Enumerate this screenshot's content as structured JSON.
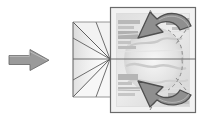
{
  "figure": {
    "width": 203,
    "height": 119,
    "background_color": "#ffffff",
    "description": "A gray block arrow points right toward a bowtie-shaped projection cone, which converges on a framed banknote image marked with two curved 180-degree rotation arrows and dashed corner guides."
  },
  "colors": {
    "arrow_fill": "#9a9a9a",
    "arrow_stroke": "#6e6e6e",
    "line_stroke": "#5f5f5f",
    "frame_stroke": "#6b6b6b",
    "frame_fill": "#f2f2f2",
    "note_base": "#d8d8d8",
    "note_light": "#ebebeb",
    "note_mid": "#c6c6c6",
    "note_dark": "#b3b3b3",
    "rotation_arrow_fill": "#8f8f8f",
    "rotation_arrow_stroke": "#4f4f4f",
    "dashed_stroke": "#8a8a8a",
    "cone_shade": "#dcdcdc",
    "background": "#ffffff"
  },
  "elements": {
    "input_arrow": {
      "name": "Input direction arrow",
      "direction": "right",
      "x": 9,
      "y": 49,
      "width": 40,
      "height": 22
    },
    "projection_cone": {
      "name": "Projection cone (bowtie)",
      "left_plane_x": 73,
      "top_y": 22,
      "bottom_y": 97,
      "focus_x": 110,
      "focus_y": 59
    },
    "optical_axis": {
      "name": "Optical axis line",
      "y": 59,
      "x_start": 73,
      "x_end": 196
    },
    "image_frame": {
      "name": "Banknote image frame",
      "x": 110,
      "y": 7,
      "width": 86,
      "height": 106
    },
    "rotation_arrow_top": {
      "name": "Top rotation arrow",
      "label": "rotate",
      "direction": "counter-clockwise-down-left"
    },
    "rotation_arrow_bottom": {
      "name": "Bottom rotation arrow",
      "label": "rotate",
      "direction": "counter-clockwise-up-left"
    },
    "corner_guides": {
      "name": "Dashed corner guides",
      "count": 4,
      "style": "dashed"
    }
  },
  "icons": {
    "block_arrow": "block-arrow-right-icon",
    "rotate_top": "rotate-arrow-icon",
    "rotate_bottom": "rotate-arrow-icon"
  }
}
